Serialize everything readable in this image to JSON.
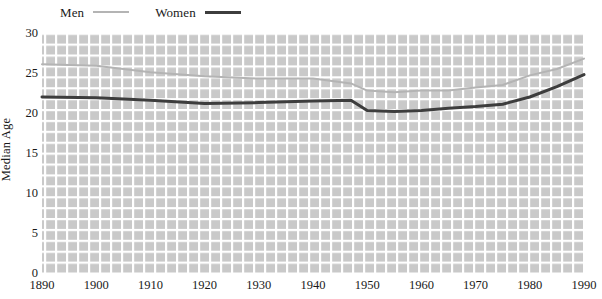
{
  "chart_data": {
    "type": "line",
    "title": "",
    "subtitle": "",
    "xlabel": "",
    "ylabel": "Median Age",
    "xlim": [
      1890,
      1990
    ],
    "ylim": [
      0,
      30
    ],
    "grid": true,
    "legend_position": "top-left",
    "x_ticks": [
      1890,
      1900,
      1910,
      1920,
      1930,
      1940,
      1950,
      1960,
      1970,
      1980,
      1990
    ],
    "y_ticks": [
      0,
      5,
      10,
      15,
      20,
      25,
      30
    ],
    "x": [
      1890,
      1900,
      1910,
      1920,
      1930,
      1940,
      1947,
      1950,
      1955,
      1960,
      1965,
      1970,
      1975,
      1980,
      1985,
      1990
    ],
    "series": [
      {
        "name": "Men",
        "color": "#b4b4b4",
        "width": 2.0,
        "values": [
          26.1,
          25.9,
          25.1,
          24.6,
          24.3,
          24.3,
          23.7,
          22.8,
          22.6,
          22.8,
          22.8,
          23.2,
          23.5,
          24.7,
          25.5,
          26.8
        ]
      },
      {
        "name": "Women",
        "color": "#3d3d3d",
        "width": 3.0,
        "values": [
          22.0,
          21.9,
          21.6,
          21.2,
          21.3,
          21.5,
          21.6,
          20.3,
          20.2,
          20.3,
          20.6,
          20.8,
          21.1,
          22.0,
          23.3,
          24.8
        ]
      }
    ]
  },
  "legend": {
    "entries": [
      {
        "label": "Men"
      },
      {
        "label": "Women"
      }
    ]
  },
  "axes": {
    "y_title": "Median Age"
  },
  "colors": {
    "men_line": "#b4b4b4",
    "women_line": "#3d3d3d",
    "plot_background": "#c9c9c9",
    "gridline": "#ffffff"
  }
}
